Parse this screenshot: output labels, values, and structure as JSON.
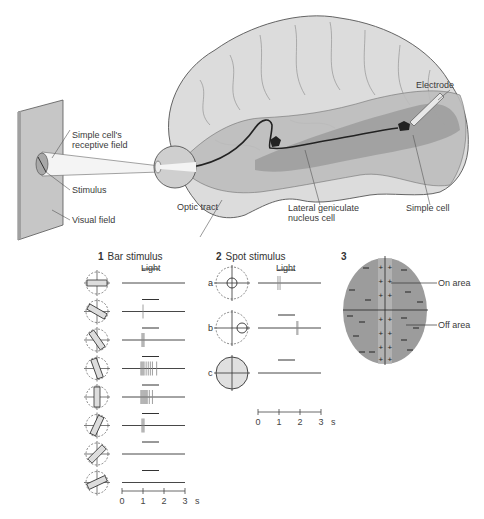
{
  "top_illustration": {
    "labels": {
      "receptive_field": "Simple cell's\nreceptive field",
      "receptive_field_line1": "Simple cell's",
      "receptive_field_line2": "receptive field",
      "stimulus": "Stimulus",
      "visual_field": "Visual field",
      "optic_tract": "Optic tract",
      "lgn_line1": "Lateral geniculate",
      "lgn_line2": "nucleus cell",
      "simple_cell": "Simple cell",
      "electrode": "Electrode"
    }
  },
  "panel1": {
    "number": "1",
    "title": "Bar stimulus",
    "light_label": "Light",
    "rows": [
      {
        "orientation_deg": 0,
        "spikes": []
      },
      {
        "orientation_deg": 30,
        "spikes": [
          1.0
        ]
      },
      {
        "orientation_deg": 55,
        "spikes": [
          0.95,
          1.0,
          1.05
        ]
      },
      {
        "orientation_deg": 70,
        "spikes": [
          0.9,
          0.95,
          1.0,
          1.05,
          1.15,
          1.25,
          1.35,
          1.45,
          1.65
        ]
      },
      {
        "orientation_deg": 90,
        "spikes": [
          0.9,
          0.95,
          1.0,
          1.05,
          1.1,
          1.15,
          1.2,
          1.3,
          1.45
        ]
      },
      {
        "orientation_deg": 115,
        "spikes": [
          0.95,
          1.0,
          1.05
        ]
      },
      {
        "orientation_deg": 135,
        "spikes": []
      },
      {
        "orientation_deg": 155,
        "spikes": []
      }
    ],
    "time_axis": {
      "ticks": [
        "0",
        "1",
        "2",
        "3"
      ],
      "unit": "s"
    }
  },
  "panel2": {
    "number": "2",
    "title": "Spot stimulus",
    "light_label": "Light",
    "rows": [
      {
        "label": "a",
        "spot": "center",
        "spikes": [
          0.95,
          1.05
        ]
      },
      {
        "label": "b",
        "spot": "flank",
        "spikes": [
          1.85,
          1.9
        ]
      },
      {
        "label": "c",
        "spot": "full",
        "spikes": []
      }
    ],
    "time_axis": {
      "ticks": [
        "0",
        "1",
        "2",
        "3"
      ],
      "unit": "s"
    }
  },
  "panel3": {
    "number": "3",
    "on_area_label": "On area",
    "off_area_label": "Off area"
  },
  "colors": {
    "ink": "#3a3a3a",
    "brain_fill": "#d9d9d9",
    "brain_dark": "#a8a8a8",
    "visual_field": "#c8c8c8",
    "ellipse": "#9a9a9a",
    "ellipse_center": "#b8b8b8",
    "spike": "#8a8a8a"
  }
}
